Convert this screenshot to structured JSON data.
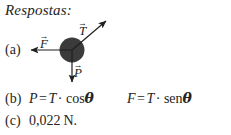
{
  "heading": "Respostas:",
  "answers": {
    "a": {
      "label": "(a)",
      "diagram": {
        "ball_color": "#3b3b3b",
        "stroke_color": "#1f1f1f",
        "vectors": [
          {
            "name": "T",
            "symbol": "T",
            "accent": "→",
            "direction": "up-right",
            "angle_deg": 50
          },
          {
            "name": "F",
            "symbol": "F",
            "accent": "→",
            "direction": "left",
            "angle_deg": 180
          },
          {
            "name": "P",
            "symbol": "P",
            "accent": "→",
            "direction": "down",
            "angle_deg": 270
          }
        ]
      }
    },
    "b": {
      "label": "(b)",
      "equation_left": {
        "lhs": "P",
        "equals": "=",
        "rhs_factor": "T",
        "dot": "·",
        "function": "cos",
        "angle": "θ"
      },
      "equation_right": {
        "lhs": "F",
        "equals": "=",
        "rhs_factor": "T",
        "dot": "·",
        "function": "sen",
        "angle": "θ"
      }
    },
    "c": {
      "label": "(c)",
      "value": "0,022",
      "unit": "N."
    }
  }
}
